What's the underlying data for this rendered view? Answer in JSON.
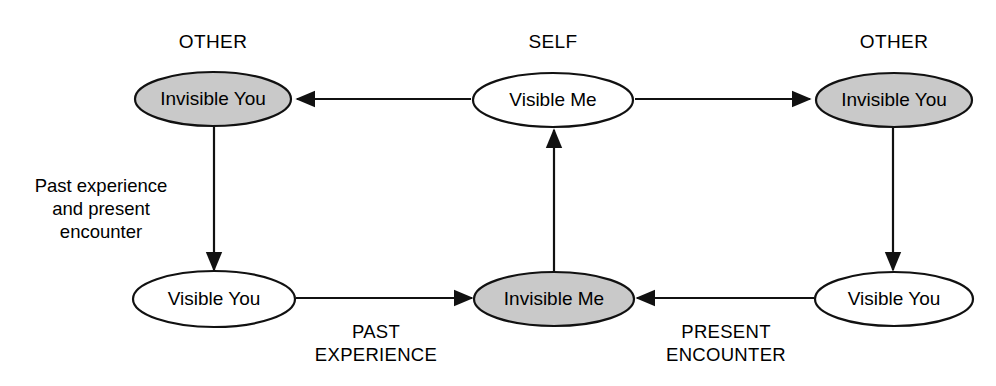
{
  "diagram": {
    "canvas": {
      "width": 996,
      "height": 386
    },
    "colors": {
      "stroke": "#111111",
      "filled_node_fill": "#c9c9c9",
      "open_node_fill": "#ffffff",
      "background": "#ffffff",
      "text": "#000000"
    },
    "group_labels": [
      {
        "id": "group-other-left",
        "text": "OTHER",
        "x": 213,
        "y": 48
      },
      {
        "id": "group-self",
        "text": "SELF",
        "x": 553,
        "y": 48
      },
      {
        "id": "group-other-right",
        "text": "OTHER",
        "x": 894,
        "y": 48
      }
    ],
    "nodes": [
      {
        "id": "invisible-you-left",
        "label": "Invisible You",
        "fill": "filled",
        "cx": 213,
        "cy": 99,
        "rx": 78,
        "ry": 27
      },
      {
        "id": "visible-me",
        "label": "Visible Me",
        "fill": "open",
        "cx": 553,
        "cy": 100,
        "rx": 80,
        "ry": 27
      },
      {
        "id": "invisible-you-right",
        "label": "Invisible You",
        "fill": "filled",
        "cx": 894,
        "cy": 100,
        "rx": 78,
        "ry": 27
      },
      {
        "id": "visible-you-left",
        "label": "Visible You",
        "fill": "open",
        "cx": 214,
        "cy": 299,
        "rx": 81,
        "ry": 28
      },
      {
        "id": "invisible-me",
        "label": "Invisible Me",
        "fill": "filled",
        "cx": 554,
        "cy": 299,
        "rx": 80,
        "ry": 27
      },
      {
        "id": "visible-you-right",
        "label": "Visible You",
        "fill": "open",
        "cx": 894,
        "cy": 299,
        "rx": 79,
        "ry": 27
      }
    ],
    "edges": [
      {
        "id": "edge-visible-me-to-invisible-you-left",
        "from": "visible-me",
        "to": "invisible-you-left",
        "direction": "left",
        "label": null
      },
      {
        "id": "edge-visible-me-to-invisible-you-right",
        "from": "visible-me",
        "to": "invisible-you-right",
        "direction": "right",
        "label": null
      },
      {
        "id": "edge-invisible-you-left-to-visible-you-left",
        "from": "invisible-you-left",
        "to": "visible-you-left",
        "direction": "down",
        "label": "Past experience and present encounter"
      },
      {
        "id": "edge-invisible-you-right-to-visible-you-right",
        "from": "invisible-you-right",
        "to": "visible-you-right",
        "direction": "down",
        "label": null
      },
      {
        "id": "edge-visible-you-left-to-invisible-me",
        "from": "visible-you-left",
        "to": "invisible-me",
        "direction": "right",
        "label": "PAST EXPERIENCE"
      },
      {
        "id": "edge-visible-you-right-to-invisible-me",
        "from": "visible-you-right",
        "to": "invisible-me",
        "direction": "left",
        "label": "PRESENT ENCOUNTER"
      },
      {
        "id": "edge-invisible-me-to-visible-me",
        "from": "invisible-me",
        "to": "visible-me",
        "direction": "up",
        "label": null
      }
    ],
    "edge_labels": {
      "left_vertical_line1": "Past experience",
      "left_vertical_line2": "and present",
      "left_vertical_line3": "encounter",
      "bottom_left_line1": "PAST",
      "bottom_left_line2": "EXPERIENCE",
      "bottom_right_line1": "PRESENT",
      "bottom_right_line2": "ENCOUNTER"
    }
  }
}
